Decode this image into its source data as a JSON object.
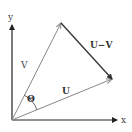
{
  "diagram": {
    "type": "vector-subtraction",
    "axes": {
      "x_label": "x",
      "y_label": "y",
      "color": "#222222"
    },
    "vectors": {
      "v": {
        "label": "V",
        "color": "#888888"
      },
      "u": {
        "label": "U",
        "color": "#888888"
      },
      "u_minus_v": {
        "label": "U−V",
        "color": "#333333"
      }
    },
    "angle": {
      "label": "Θ"
    }
  }
}
